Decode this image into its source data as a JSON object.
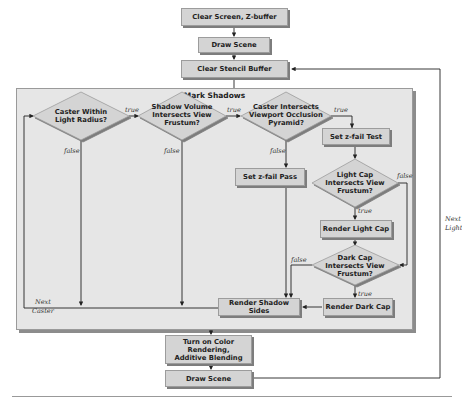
{
  "diagram": {
    "type": "flowchart",
    "nodes": {
      "clear_screen": "Clear Screen, Z-buffer",
      "draw_scene_top": "Draw Scene",
      "clear_stencil": "Clear Stencil Buffer",
      "mark_shadows_group": "Mark Shadows",
      "caster_within_radius": [
        "Caster Within",
        "Light Radius?"
      ],
      "shadow_volume_frustum": [
        "Shadow Volume",
        "Intersects View",
        "Frustum?"
      ],
      "caster_occlusion": [
        "Caster Intersects",
        "Viewport Occlusion",
        "Pyramid?"
      ],
      "set_zfail_test": "Set z-fail Test",
      "set_zfail_pass": "Set z-fail Pass",
      "light_cap_frustum": [
        "Light Cap",
        "Intersects View",
        "Frustum?"
      ],
      "render_light_cap": "Render Light Cap",
      "dark_cap_frustum": [
        "Dark Cap",
        "Intersects View",
        "Frustum?"
      ],
      "render_dark_cap": "Render Dark Cap",
      "render_shadow_sides": "Render Shadow Sides",
      "color_rendering": [
        "Turn on Color Rendering,",
        "Additive Blending"
      ],
      "draw_scene_bottom": "Draw Scene"
    },
    "edge_labels": {
      "true": "true",
      "false": "false",
      "next_caster": [
        "Next",
        "Caster"
      ],
      "next_light": [
        "Next",
        "Light"
      ]
    },
    "edges": [
      {
        "from": "clear_screen",
        "to": "draw_scene_top"
      },
      {
        "from": "draw_scene_top",
        "to": "clear_stencil"
      },
      {
        "from": "clear_stencil",
        "to": "caster_within_radius"
      },
      {
        "from": "caster_within_radius",
        "to": "shadow_volume_frustum",
        "label": "true"
      },
      {
        "from": "caster_within_radius",
        "to": "render_shadow_sides",
        "label": "false"
      },
      {
        "from": "shadow_volume_frustum",
        "to": "caster_occlusion",
        "label": "true"
      },
      {
        "from": "shadow_volume_frustum",
        "to": "render_shadow_sides",
        "label": "false"
      },
      {
        "from": "caster_occlusion",
        "to": "set_zfail_test",
        "label": "true"
      },
      {
        "from": "caster_occlusion",
        "to": "set_zfail_pass",
        "label": "false"
      },
      {
        "from": "set_zfail_pass",
        "to": "render_shadow_sides"
      },
      {
        "from": "set_zfail_test",
        "to": "light_cap_frustum"
      },
      {
        "from": "light_cap_frustum",
        "to": "render_light_cap",
        "label": "true"
      },
      {
        "from": "light_cap_frustum",
        "to": "dark_cap_frustum",
        "label": "false"
      },
      {
        "from": "render_light_cap",
        "to": "dark_cap_frustum"
      },
      {
        "from": "dark_cap_frustum",
        "to": "render_dark_cap",
        "label": "true"
      },
      {
        "from": "dark_cap_frustum",
        "to": "render_shadow_sides",
        "label": "false"
      },
      {
        "from": "render_dark_cap",
        "to": "render_shadow_sides"
      },
      {
        "from": "render_shadow_sides",
        "to": "caster_within_radius",
        "label": "Next Caster"
      },
      {
        "from": "render_shadow_sides",
        "to": "color_rendering"
      },
      {
        "from": "color_rendering",
        "to": "draw_scene_bottom"
      },
      {
        "from": "draw_scene_bottom",
        "to": "clear_stencil",
        "label": "Next Light"
      }
    ]
  },
  "caption": {
    "visible_fragment": "Figure ... (truncated at image edge)"
  }
}
